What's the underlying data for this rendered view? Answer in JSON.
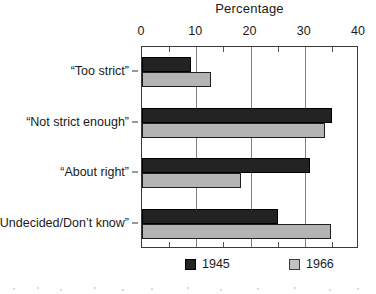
{
  "chart_data": {
    "type": "bar",
    "orientation": "horizontal",
    "title": "Percentage",
    "xlabel": "Percentage",
    "ylabel": "",
    "xlim": [
      0,
      40
    ],
    "xticks": [
      0,
      10,
      20,
      30,
      40
    ],
    "xtick_labels": [
      "0",
      "10",
      "20",
      "30",
      "40"
    ],
    "minor_tick_interval": 5,
    "grid": true,
    "grid_axis": "x",
    "legend_position": "bottom",
    "categories": [
      "“Too strict”",
      "“Not strict enough”",
      "“About right”",
      "“Undecided/Don’t know”"
    ],
    "series": [
      {
        "name": "1945",
        "color": "#232323",
        "values": [
          9.0,
          35.0,
          31.0,
          25.0
        ]
      },
      {
        "name": "1966",
        "color": "#b4b4b4",
        "values": [
          12.8,
          33.8,
          18.2,
          34.8
        ]
      }
    ]
  },
  "legend": {
    "items": [
      {
        "label": "1945",
        "swatch": "black-square-swatch"
      },
      {
        "label": "1966",
        "swatch": "gray-square-swatch"
      }
    ]
  }
}
